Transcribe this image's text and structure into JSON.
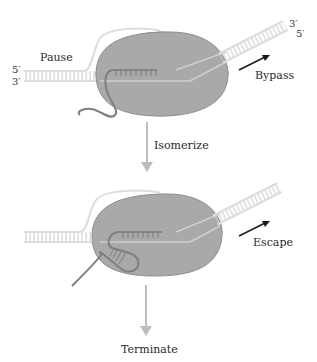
{
  "diagram": {
    "colors": {
      "polymerase": "#a9a9a9",
      "polymerase_outline": "#8a8a8a",
      "dna": "#e0e0e0",
      "dna_rung": "#d0d0d0",
      "rna": "#8e8e8e",
      "process_arrow": "#b8b8b8",
      "exit_arrow": "#1a1a1a",
      "text": "#2a2a2a"
    },
    "top_state": {
      "label_left": "Pause",
      "strand_labels_left": [
        "5′",
        "3′"
      ],
      "strand_labels_right": [
        "3′",
        "5′"
      ],
      "exit_label": "Bypass"
    },
    "transition": {
      "label": "Isomerize"
    },
    "bottom_state": {
      "exit_label": "Escape"
    },
    "final": {
      "label": "Terminate"
    }
  }
}
